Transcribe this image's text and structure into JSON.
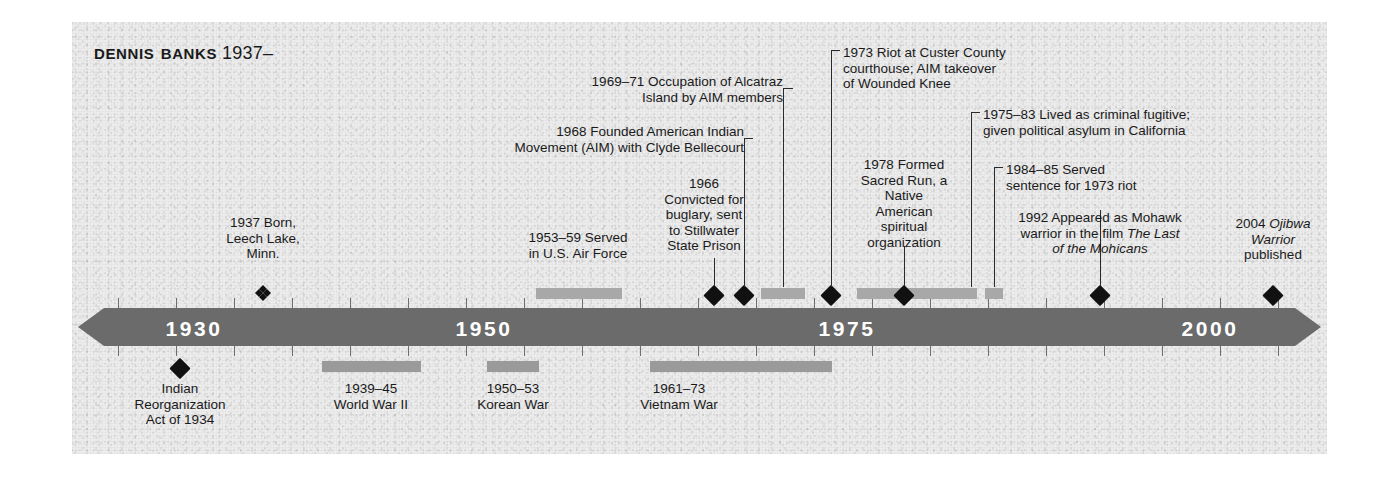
{
  "title": {
    "name": "Dennis Banks",
    "years": "1937–"
  },
  "axis": {
    "labels": [
      {
        "text": "1930",
        "year": 1930
      },
      {
        "text": "1950",
        "year": 1950
      },
      {
        "text": "1975",
        "year": 1975
      },
      {
        "text": "2000",
        "year": 2000
      }
    ],
    "range": [
      1927,
      2008
    ],
    "tick_interval_years": 5
  },
  "events_above": [
    {
      "id": "born",
      "text": "1937 Born,\nLeech Lake,\nMinn.",
      "marker": "quad-diamond",
      "year": 1937
    },
    {
      "id": "air-force",
      "text": "1953–59 Served\nin U.S. Air Force",
      "marker": "span-bar",
      "start": 1953,
      "end": 1959
    },
    {
      "id": "burglary",
      "text": "1966\nConvicted for\nbuglary, sent\nto Stillwater\nState Prison",
      "marker": "diamond",
      "year": 1966
    },
    {
      "id": "aim-founded",
      "text": "1968 Founded American Indian\nMovement (AIM) with Clyde Bellecourt",
      "marker": "diamond",
      "year": 1968
    },
    {
      "id": "alcatraz",
      "text": "1969–71 Occupation of Alcatraz\nIsland by AIM members",
      "marker": "span-bar",
      "start": 1969,
      "end": 1971
    },
    {
      "id": "custer-riot",
      "text": "1973 Riot at Custer County\ncourthouse; AIM takeover\nof Wounded Knee",
      "marker": "diamond",
      "year": 1973
    },
    {
      "id": "sacred-run",
      "text": "1978 Formed\nSacred Run, a\nNative\nAmerican\nspiritual\norganization",
      "marker": "diamond",
      "year": 1978
    },
    {
      "id": "fugitive",
      "text": "1975–83 Lived as criminal fugitive;\ngiven political asylum in California",
      "marker": "span-bar",
      "start": 1975,
      "end": 1983
    },
    {
      "id": "sentence",
      "text": "1984–85 Served\nsentence for 1973 riot",
      "marker": "span-bar",
      "start": 1984,
      "end": 1985
    },
    {
      "id": "mohicans",
      "text_part1": "1992 Appeared as Mohawk\nwarrior in the film ",
      "text_italic": "The Last\nof the Mohicans",
      "marker": "diamond",
      "year": 1992
    },
    {
      "id": "ojibwa-warrior",
      "text_part1": "2004 ",
      "text_italic": "Ojibwa\nWarrior",
      "text_part2": "\npublished",
      "marker": "diamond",
      "year": 2004
    }
  ],
  "events_below": [
    {
      "id": "indian-reorganization",
      "text": "Indian\nReorganization\nAct of 1934",
      "marker": "diamond",
      "year": 1934
    },
    {
      "id": "world-war-two",
      "text": "1939–45\nWorld War II",
      "marker": "span-bar",
      "start": 1939,
      "end": 1945
    },
    {
      "id": "korean-war",
      "text": "1950–53\nKorean War",
      "marker": "span-bar",
      "start": 1950,
      "end": 1953
    },
    {
      "id": "vietnam-war",
      "text": "1961–73\nVietnam War",
      "marker": "span-bar",
      "start": 1961,
      "end": 1973
    }
  ],
  "colors": {
    "bar": "#6b6b6b",
    "span_bar": "#a8a8a8",
    "marker": "#111111",
    "text": "#1a1a1a",
    "year_label": "#ffffff",
    "panel": "#ededed"
  }
}
